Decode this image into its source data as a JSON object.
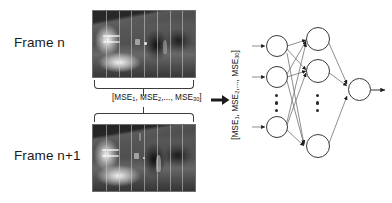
{
  "diagram": {
    "frames": [
      {
        "label": "Frame n",
        "image_description": "Grayscale indoor corridor scene with bright sunlit windows on the left, dark ceiling beam, dark doorway and wall panels on the right, divided into vertical column strips",
        "grid_columns": 8
      },
      {
        "label": "Frame n+1",
        "image_description": "Grayscale indoor corridor scene one frame later, same viewpoint, with a person silhouette near the centre right, divided into vertical column strips",
        "grid_columns": 8
      }
    ],
    "mse_vector": {
      "open_bracket": "[",
      "terms": [
        {
          "name": "MSE",
          "sub": "1",
          "sep": ", "
        },
        {
          "name": "MSE",
          "sub": "2",
          "sep": ",..., "
        },
        {
          "name": "MSE",
          "sub": "30",
          "sep": ""
        }
      ],
      "close_bracket": "]",
      "full_text": "[MSE1, MSE2,..., MSE30]",
      "count": 30
    },
    "arrow": {
      "name": "transfer-arrow",
      "direction": "right"
    },
    "network": {
      "layers": [
        {
          "name": "input-layer",
          "visible_nodes": 3,
          "has_ellipsis": true,
          "ellipsis_dots": 3
        },
        {
          "name": "hidden-layer",
          "visible_nodes": 3,
          "has_ellipsis": true,
          "ellipsis_dots": 3
        },
        {
          "name": "output-layer",
          "visible_nodes": 1,
          "has_ellipsis": false,
          "ellipsis_dots": 0
        }
      ],
      "output_arrow": true
    },
    "colors": {
      "stroke": "#3a3a3a",
      "text": "#111111",
      "node_fill": "#ffffff",
      "background": "#ffffff",
      "grid_line": "rgba(205,205,205,0.55)"
    }
  }
}
